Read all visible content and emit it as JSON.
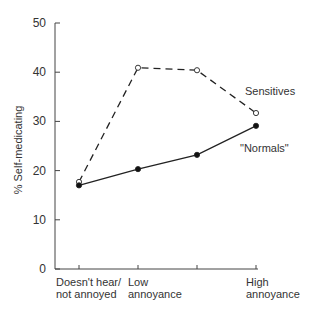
{
  "chart_data": {
    "type": "line",
    "title": "",
    "xlabel": "",
    "ylabel": "% Self-medicating",
    "ylim": [
      0,
      50
    ],
    "yticks": [
      0,
      10,
      20,
      30,
      40,
      50
    ],
    "grid": false,
    "legend_position": "inline labels at right",
    "categories": [
      "Doesn't hear/ not annoyed",
      "Low annoyance",
      "",
      "High annoyance"
    ],
    "category_labels": [
      [
        "Doesn't hear/",
        "not annoyed"
      ],
      [
        "Low",
        "annoyance"
      ],
      [
        "",
        ""
      ],
      [
        "High",
        "annoyance"
      ]
    ],
    "series": [
      {
        "name": "Sensitives",
        "style": "dashed",
        "marker": "open-circle",
        "values": [
          17.7,
          40.9,
          40.4,
          31.7
        ]
      },
      {
        "name": "\"Normals\"",
        "style": "solid",
        "marker": "filled-circle",
        "values": [
          17.0,
          20.3,
          23.2,
          29.1
        ]
      }
    ]
  }
}
